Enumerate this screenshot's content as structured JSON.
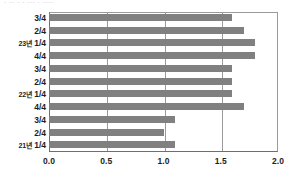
{
  "top_fragment": "· ·· · · ··· · ····",
  "chart_data": {
    "type": "bar",
    "orientation": "horizontal",
    "title": "",
    "subtitle": "",
    "xlabel": "",
    "ylabel": "",
    "xlim": [
      0.0,
      2.0
    ],
    "xticks": [
      0.0,
      0.5,
      1.0,
      1.5,
      2.0
    ],
    "xtick_labels": [
      "0.0",
      "0.5",
      "1.0",
      "1.5",
      "2.0"
    ],
    "grid": "vertical",
    "legend": "none",
    "bar_color": "#808080",
    "axis_color": "#6e6e6e",
    "gridline_color": "#9a9a9a",
    "categories": [
      "3/4",
      "2/4",
      "23년 1/4",
      "4/4",
      "3/4",
      "2/4",
      "22년 1/4",
      "4/4",
      "3/4",
      "2/4",
      "21년 1/4"
    ],
    "category_year_prefix": [
      "",
      "",
      "23년",
      "",
      "",
      "",
      "22년",
      "",
      "",
      "",
      "21년"
    ],
    "category_quarter": [
      "3/4",
      "2/4",
      "1/4",
      "4/4",
      "3/4",
      "2/4",
      "1/4",
      "4/4",
      "3/4",
      "2/4",
      "1/4"
    ],
    "values": [
      1.6,
      1.7,
      1.8,
      1.8,
      1.6,
      1.6,
      1.6,
      1.7,
      1.1,
      1.0,
      1.1
    ]
  }
}
